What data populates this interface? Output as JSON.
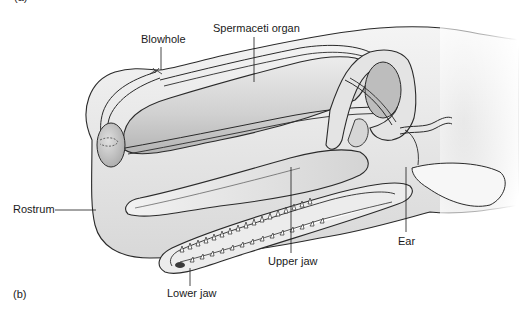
{
  "figure": {
    "panel_top_label": "(a)",
    "panel_label": "(b)",
    "labels": {
      "blowhole": "Blowhole",
      "spermaceti_organ": "Spermaceti organ",
      "rostrum": "Rostrum",
      "upper_jaw": "Upper jaw",
      "ear": "Ear",
      "lower_jaw": "Lower jaw"
    },
    "colors": {
      "outline": "#2a2a2a",
      "fill_light": "#e8e8e8",
      "fill_mid": "#cfcfcf",
      "fill_dark": "#a8a8a8",
      "background": "#ffffff"
    }
  }
}
